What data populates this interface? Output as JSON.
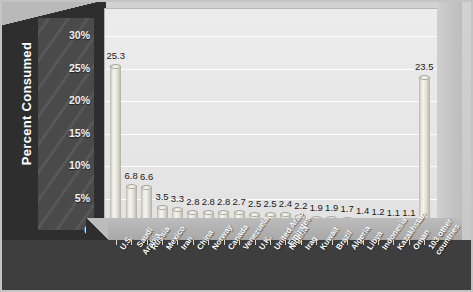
{
  "chart_data": {
    "type": "bar",
    "title": "",
    "xlabel": "",
    "ylabel": "Percent Consumed",
    "ylim": [
      0,
      32
    ],
    "grid": true,
    "legend": "none",
    "ytick_labels": [
      "30%",
      "25%",
      "20%",
      "15%",
      "10%",
      "5%",
      "0"
    ],
    "ytick_values": [
      30,
      25,
      20,
      15,
      10,
      5,
      0
    ],
    "categories": [
      "U.S.",
      "Saudi\nArabia",
      "Russia",
      "Mexico",
      "Iran",
      "China",
      "Norway",
      "Canada",
      "Venezuela",
      "U.K.",
      "United Arab\nEmirates",
      "Nigeria",
      "Iraq",
      "Kuwait",
      "Brazil",
      "Algeria",
      "Libya",
      "Indonesia",
      "Kazakhstan",
      "Oman",
      "103 other\ncountries"
    ],
    "values": [
      25.3,
      6.8,
      6.6,
      3.5,
      3.3,
      2.8,
      2.8,
      2.8,
      2.7,
      2.5,
      2.5,
      2.4,
      2.2,
      1.9,
      1.9,
      1.7,
      1.4,
      1.2,
      1.1,
      1.1,
      23.5
    ],
    "value_labels": [
      "25.3",
      "6.8",
      "6.6",
      "3.5",
      "3.3",
      "2.8",
      "2.8",
      "2.8",
      "2.7",
      "2.5",
      "2.5",
      "2.4",
      "2.2",
      "1.9",
      "1.9",
      "1.7",
      "1.4",
      "1.2",
      "1.1",
      "1.1",
      "23.5"
    ],
    "colors": {
      "bar_fill": "#f0efe8",
      "bar_edge": "#a9a79b",
      "plot_background": "#e9e9e9",
      "wall": "#2e2e2e",
      "axis_panel": "#4a4a4a",
      "gridline": "#ffffff",
      "label_text": "#ffffff",
      "value_text": "#1a1a1a"
    }
  }
}
